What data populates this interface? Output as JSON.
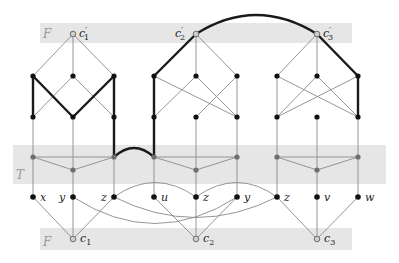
{
  "figure": {
    "bands": {
      "top_F": {
        "label": "F"
      },
      "middle_T": {
        "label": "T"
      },
      "bottom_F": {
        "label": "F"
      }
    },
    "clause_top_nodes": [
      {
        "id": "c1p",
        "label": "c′1",
        "main": "c",
        "sub": "1",
        "prime": "′"
      },
      {
        "id": "c2p",
        "label": "c′2",
        "main": "c",
        "sub": "2",
        "prime": "′"
      },
      {
        "id": "c3p",
        "label": "c′3",
        "main": "c",
        "sub": "3",
        "prime": "′"
      }
    ],
    "clause_bottom_nodes": [
      {
        "id": "c1",
        "label": "c1",
        "main": "c",
        "sub": "1"
      },
      {
        "id": "c2",
        "label": "c2",
        "main": "c",
        "sub": "2"
      },
      {
        "id": "c3",
        "label": "c3",
        "main": "c",
        "sub": "3"
      }
    ],
    "variable_nodes": [
      {
        "label": "x",
        "gadget": 1
      },
      {
        "label": "y",
        "gadget": 1
      },
      {
        "label": "z",
        "gadget": 1
      },
      {
        "label": "u",
        "gadget": 2
      },
      {
        "label": "z",
        "gadget": 2
      },
      {
        "label": "y",
        "gadget": 2
      },
      {
        "label": "z",
        "gadget": 3
      },
      {
        "label": "v",
        "gadget": 3
      },
      {
        "label": "w",
        "gadget": 3
      }
    ],
    "colors": {
      "band": "#e6e6e6",
      "thin_edge": "#8a8a8a",
      "thick_edge": "#1a1a1a",
      "black_node": "#111111",
      "gray_node": "#6e6e6e"
    }
  }
}
